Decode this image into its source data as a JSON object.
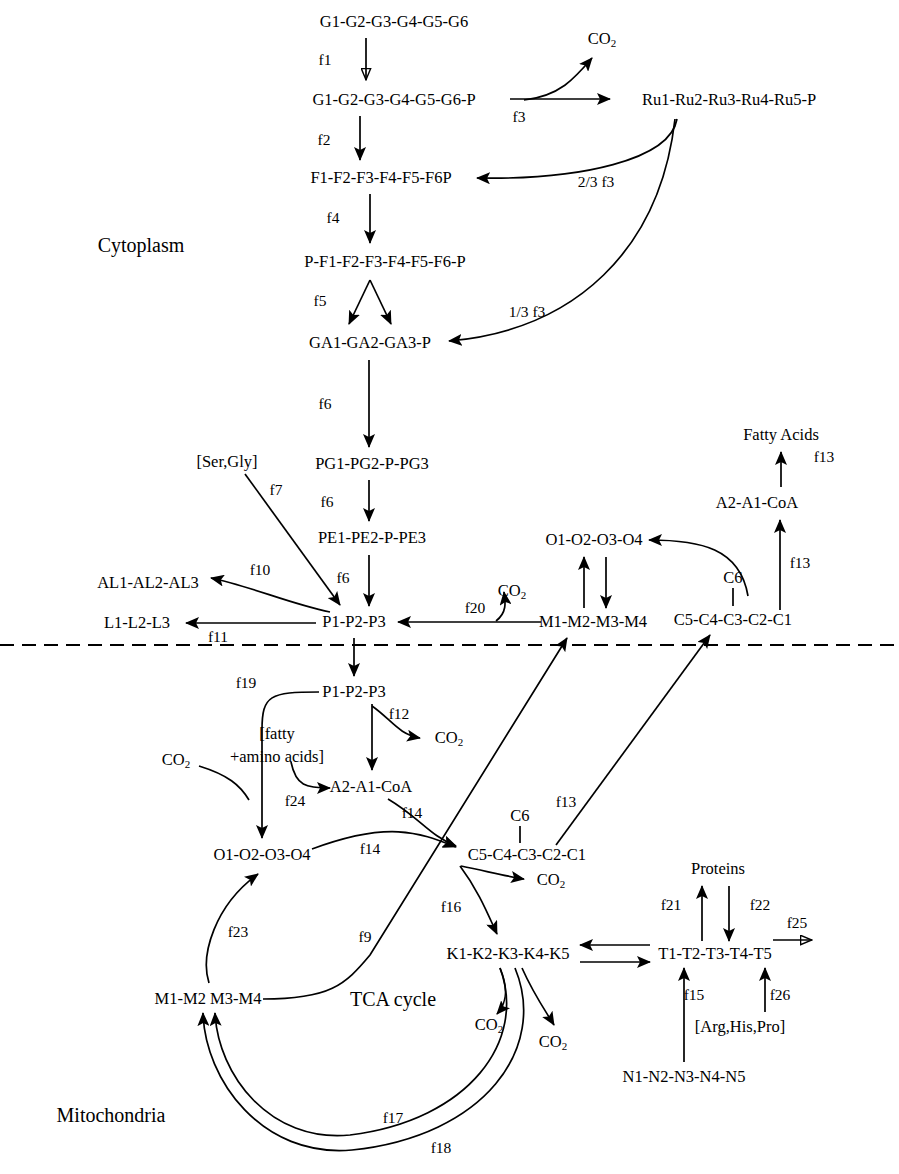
{
  "diagram": {
    "compartments": [
      {
        "id": "cytoplasm",
        "label": "Cytoplasm"
      },
      {
        "id": "mitochondria",
        "label": "Mitochondria"
      },
      {
        "id": "tca",
        "label": "TCA cycle"
      }
    ],
    "membrane": {
      "style": "dashed",
      "y": 645
    },
    "metabolites": [
      {
        "id": "glc",
        "label": "G1-G2-G3-G4-G5-G6",
        "x": 394,
        "y": 22
      },
      {
        "id": "g6p",
        "label": "G1-G2-G3-G4-G5-G6-P",
        "x": 394,
        "y": 100
      },
      {
        "id": "ru5p",
        "label": "Ru1-Ru2-Ru3-Ru4-Ru5-P",
        "x": 729,
        "y": 100
      },
      {
        "id": "co2_f3",
        "label": "CO2",
        "x": 602,
        "y": 40
      },
      {
        "id": "f6p",
        "label": "F1-F2-F3-F4-F5-F6P",
        "x": 381,
        "y": 178
      },
      {
        "id": "fbp",
        "label": "P-F1-F2-F3-F4-F5-F6-P",
        "x": 385,
        "y": 262
      },
      {
        "id": "gap",
        "label": "GA1-GA2-GA3-P",
        "x": 370,
        "y": 343
      },
      {
        "id": "pg",
        "label": "PG1-PG2-P-PG3",
        "x": 372,
        "y": 464
      },
      {
        "id": "pep",
        "label": "PE1-PE2-P-PE3",
        "x": 372,
        "y": 538
      },
      {
        "id": "pyr_cyt",
        "label": "P1-P2-P3",
        "x": 354,
        "y": 622
      },
      {
        "id": "sergly",
        "label": "[Ser,Gly]",
        "x": 227,
        "y": 462
      },
      {
        "id": "ala",
        "label": "AL1-AL2-AL3",
        "x": 148,
        "y": 583
      },
      {
        "id": "lac",
        "label": "L1-L2-L3",
        "x": 137,
        "y": 623
      },
      {
        "id": "co2_f20",
        "label": "CO2",
        "x": 512,
        "y": 592
      },
      {
        "id": "mal_cyt",
        "label": "M1-M2-M3-M4",
        "x": 593,
        "y": 622
      },
      {
        "id": "oaa_cyt",
        "label": "O1-O2-O3-O4",
        "x": 594,
        "y": 540
      },
      {
        "id": "cit_cyt",
        "label": "C5-C4-C3-C2-C1",
        "x": 733,
        "y": 620
      },
      {
        "id": "c6_cyt",
        "label": "C6",
        "x": 733,
        "y": 578
      },
      {
        "id": "accoa_cyt",
        "label": "A2-A1-CoA",
        "x": 757,
        "y": 503
      },
      {
        "id": "fa",
        "label": "Fatty Acids",
        "x": 781,
        "y": 435
      },
      {
        "id": "pyr_mit",
        "label": "P1-P2-P3",
        "x": 354,
        "y": 692
      },
      {
        "id": "co2_f12",
        "label": "CO2",
        "x": 449,
        "y": 739
      },
      {
        "id": "fattyaa",
        "label": "[fatty\n+amino acids]",
        "x": 277,
        "y": 745
      },
      {
        "id": "accoa_mit",
        "label": "A2-A1-CoA",
        "x": 371,
        "y": 787
      },
      {
        "id": "co2_f19",
        "label": "CO2",
        "x": 176,
        "y": 761
      },
      {
        "id": "oaa_mit",
        "label": "O1-O2-O3-O4",
        "x": 262,
        "y": 855
      },
      {
        "id": "cit_mit",
        "label": "C5-C4-C3-C2-C1",
        "x": 527,
        "y": 855
      },
      {
        "id": "c6_mit",
        "label": "C6",
        "x": 520,
        "y": 816
      },
      {
        "id": "co2_f16",
        "label": "CO2",
        "x": 551,
        "y": 881
      },
      {
        "id": "akg",
        "label": "K1-K2-K3-K4-K5",
        "x": 508,
        "y": 954
      },
      {
        "id": "co2_a",
        "label": "CO2",
        "x": 489,
        "y": 1026
      },
      {
        "id": "co2_b",
        "label": "CO2",
        "x": 553,
        "y": 1043
      },
      {
        "id": "mal_mit",
        "label": "M1-M2 M3-M4",
        "x": 208,
        "y": 999
      },
      {
        "id": "glu",
        "label": "T1-T2-T3-T4-T5",
        "x": 715,
        "y": 954
      },
      {
        "id": "proteins",
        "label": "Proteins",
        "x": 718,
        "y": 869
      },
      {
        "id": "arghispro",
        "label": "[Arg,His,Pro]",
        "x": 740,
        "y": 1027
      },
      {
        "id": "gln",
        "label": "N1-N2-N3-N4-N5",
        "x": 684,
        "y": 1077
      }
    ],
    "fluxes": [
      {
        "id": "f1",
        "label": "f1",
        "x": 325,
        "y": 60
      },
      {
        "id": "f2",
        "label": "f2",
        "x": 324,
        "y": 140
      },
      {
        "id": "f3",
        "label": "f3",
        "x": 519,
        "y": 117
      },
      {
        "id": "f3a",
        "label": "2/3 f3",
        "x": 596,
        "y": 182
      },
      {
        "id": "f4",
        "label": "f4",
        "x": 333,
        "y": 218
      },
      {
        "id": "f5",
        "label": "f5",
        "x": 320,
        "y": 301
      },
      {
        "id": "f3b",
        "label": "1/3 f3",
        "x": 527,
        "y": 312
      },
      {
        "id": "f6a",
        "label": "f6",
        "x": 325,
        "y": 404
      },
      {
        "id": "f6b",
        "label": "f6",
        "x": 327,
        "y": 502
      },
      {
        "id": "f6c",
        "label": "f6",
        "x": 343,
        "y": 578
      },
      {
        "id": "f7",
        "label": "f7",
        "x": 276,
        "y": 490
      },
      {
        "id": "f10",
        "label": "f10",
        "x": 260,
        "y": 570
      },
      {
        "id": "f11",
        "label": "f11",
        "x": 218,
        "y": 637
      },
      {
        "id": "f20",
        "label": "f20",
        "x": 475,
        "y": 608
      },
      {
        "id": "f13a",
        "label": "f13",
        "x": 824,
        "y": 457
      },
      {
        "id": "f13b",
        "label": "f13",
        "x": 800,
        "y": 563
      },
      {
        "id": "f13c",
        "label": "f13",
        "x": 566,
        "y": 802
      },
      {
        "id": "f19",
        "label": "f19",
        "x": 246,
        "y": 683
      },
      {
        "id": "f12",
        "label": "f12",
        "x": 399,
        "y": 714
      },
      {
        "id": "f24",
        "label": "f24",
        "x": 295,
        "y": 801
      },
      {
        "id": "f14a",
        "label": "f14",
        "x": 412,
        "y": 813
      },
      {
        "id": "f14b",
        "label": "f14",
        "x": 370,
        "y": 849
      },
      {
        "id": "f16",
        "label": "f16",
        "x": 451,
        "y": 907
      },
      {
        "id": "f23",
        "label": "f23",
        "x": 238,
        "y": 932
      },
      {
        "id": "f9",
        "label": "f9",
        "x": 365,
        "y": 937
      },
      {
        "id": "f17",
        "label": "f17",
        "x": 393,
        "y": 1118
      },
      {
        "id": "f18",
        "label": "f18",
        "x": 441,
        "y": 1148
      },
      {
        "id": "f21",
        "label": "f21",
        "x": 671,
        "y": 905
      },
      {
        "id": "f22",
        "label": "f22",
        "x": 760,
        "y": 905
      },
      {
        "id": "f25",
        "label": "f25",
        "x": 797,
        "y": 923
      },
      {
        "id": "f15",
        "label": "f15",
        "x": 694,
        "y": 995
      },
      {
        "id": "f26",
        "label": "f26",
        "x": 780,
        "y": 995
      }
    ]
  }
}
